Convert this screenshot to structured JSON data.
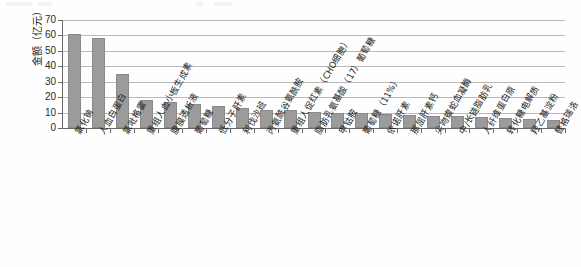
{
  "chart_data": {
    "type": "bar",
    "title": "",
    "subtitle": "",
    "xlabel": "",
    "ylabel": "金额（亿元）",
    "ylim": [
      0,
      70
    ],
    "ytick_step": 10,
    "yticks": [
      "70",
      "60",
      "50",
      "40",
      "30",
      "20",
      "10",
      "0"
    ],
    "grid": "horizontal",
    "legend": "none",
    "bar_color": "#9b9b9b",
    "categories": [
      "氯化钠",
      "人血白蛋白",
      "氯吡格雷",
      "重组人血小板生成素",
      "腹膜透析液",
      "葡萄糖",
      "低分子肝素",
      "利伐沙班",
      "丙氨酰谷氨酰胺",
      "重组人促红素（CHO细胞）",
      "脂肪乳氨基酸（17）葡萄糖",
      "甲钴胺",
      "葡萄糖（11%）",
      "依诺肝素",
      "那屈肝素钙",
      "尖吻蝮蛇血凝酶",
      "中/长链脂肪乳",
      "人纤维蛋白原",
      "转化糖电解质",
      "羟乙基淀粉",
      "替格瑞洛"
    ],
    "values": [
      61,
      58.5,
      35,
      18,
      17,
      15.5,
      14.5,
      13,
      12,
      11.5,
      10.5,
      10,
      9.5,
      9,
      8.5,
      8,
      7.5,
      7,
      6.5,
      6,
      5.5
    ]
  }
}
